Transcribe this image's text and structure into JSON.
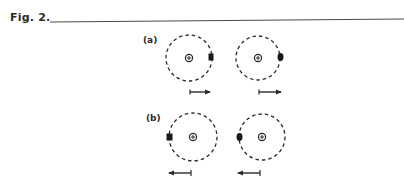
{
  "figure": {
    "label": "Fig. 2.",
    "rule_color": "#4a4a4a",
    "ink_color": "#2a2a2a"
  },
  "panels": [
    {
      "id": "a",
      "label": "(a)",
      "items": [
        {
          "nucleus_symbol": "⊕",
          "nucleus": [
            189,
            58
          ],
          "radius": 23,
          "electron_side": "right",
          "electron": [
            211,
            57
          ],
          "arrow_direction": "right",
          "arrow": {
            "x1": 190,
            "x2": 211,
            "y": 92
          }
        },
        {
          "nucleus_symbol": "⊕",
          "nucleus": [
            258,
            58
          ],
          "radius": 22,
          "electron_side": "right",
          "electron": [
            281,
            57
          ],
          "arrow_direction": "right",
          "arrow": {
            "x1": 259,
            "x2": 282,
            "y": 92
          }
        }
      ]
    },
    {
      "id": "b",
      "label": "(b)",
      "items": [
        {
          "nucleus_symbol": "⊕",
          "nucleus": [
            193,
            137
          ],
          "radius": 24,
          "electron_side": "left",
          "electron": [
            170,
            137
          ],
          "arrow_direction": "left",
          "arrow": {
            "x1": 191,
            "x2": 168,
            "y": 173
          }
        },
        {
          "nucleus_symbol": "⊕",
          "nucleus": [
            262,
            137
          ],
          "radius": 23,
          "electron_side": "left",
          "electron": [
            239,
            137
          ],
          "arrow_direction": "left",
          "arrow": {
            "x1": 260,
            "x2": 237,
            "y": 173
          }
        }
      ]
    }
  ]
}
